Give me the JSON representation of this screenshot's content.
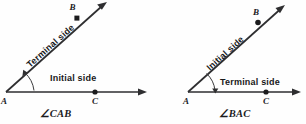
{
  "figure": {
    "background_color": "#fefefe",
    "ink_color": "#2e2e30",
    "diagrams": [
      {
        "id": "left",
        "angle_label": "∠CAB",
        "vertex_label": "A",
        "ray_point_labels": {
          "on_initial": "C",
          "on_terminal": "B"
        },
        "initial_side_label": "Initial side",
        "terminal_side_label": "Terminal side",
        "initial_side_direction": "horizontal-right",
        "terminal_side_direction": "diagonal-up-right",
        "rotation_direction": "counterclockwise"
      },
      {
        "id": "right",
        "angle_label": "∠BAC",
        "vertex_label": "A",
        "ray_point_labels": {
          "on_initial": "B",
          "on_terminal": "C"
        },
        "initial_side_label": "Initial side",
        "terminal_side_label": "Terminal side",
        "initial_side_direction": "diagonal-up-right",
        "terminal_side_direction": "horizontal-right",
        "rotation_direction": "clockwise"
      }
    ]
  }
}
